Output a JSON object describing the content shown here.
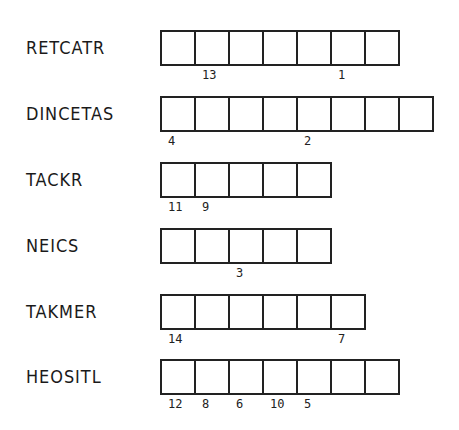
{
  "puzzle": {
    "type": "word-scramble",
    "rows": [
      {
        "scrambled": "RETCATR",
        "length": 7,
        "top": 30,
        "numbers": [
          "",
          "13",
          "",
          "",
          "",
          "1",
          ""
        ]
      },
      {
        "scrambled": "DINCETAS",
        "length": 8,
        "top": 96,
        "numbers": [
          "4",
          "",
          "",
          "",
          "2",
          "",
          "",
          ""
        ]
      },
      {
        "scrambled": "TACKR",
        "length": 5,
        "top": 162,
        "numbers": [
          "11",
          "9",
          "",
          "",
          ""
        ]
      },
      {
        "scrambled": "NEICS",
        "length": 5,
        "top": 228,
        "numbers": [
          "",
          "",
          "3",
          "",
          ""
        ]
      },
      {
        "scrambled": "TAKMER",
        "length": 6,
        "top": 294,
        "numbers": [
          "14",
          "",
          "",
          "",
          "",
          "7"
        ]
      },
      {
        "scrambled": "HEOSITL",
        "length": 7,
        "top": 359,
        "numbers": [
          "12",
          "8",
          "6",
          "10",
          "5",
          "",
          ""
        ]
      }
    ]
  },
  "colors": {
    "line": "#222222",
    "background": "#ffffff",
    "text": "#1a1a1a"
  }
}
